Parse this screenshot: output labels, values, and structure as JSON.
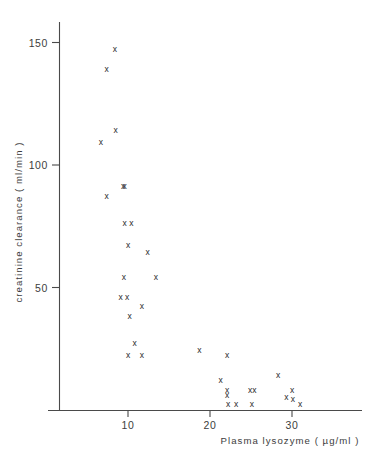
{
  "chart_data": {
    "type": "scatter",
    "title": "",
    "xlabel": "Plasma lysozyme ( µg/ml )",
    "ylabel": "creatinine clearance ( ml/min )",
    "xlim": [
      5,
      37
    ],
    "ylim": [
      0,
      162
    ],
    "grid": false,
    "legend": null,
    "marker": "x",
    "xticks": [
      10,
      20,
      30
    ],
    "xtick_labels": [
      "10",
      "20",
      "30"
    ],
    "yticks": [
      50,
      100,
      150
    ],
    "ytick_labels": [
      "50",
      "100",
      "150"
    ],
    "series": [
      {
        "name": "patients",
        "marker": "x",
        "points": [
          {
            "x": 8.4,
            "y": 147
          },
          {
            "x": 7.4,
            "y": 139
          },
          {
            "x": 8.5,
            "y": 114
          },
          {
            "x": 6.7,
            "y": 109
          },
          {
            "x": 9.4,
            "y": 91
          },
          {
            "x": 9.6,
            "y": 91
          },
          {
            "x": 7.4,
            "y": 87
          },
          {
            "x": 9.6,
            "y": 76
          },
          {
            "x": 10.4,
            "y": 76
          },
          {
            "x": 10.0,
            "y": 67
          },
          {
            "x": 12.4,
            "y": 64
          },
          {
            "x": 9.5,
            "y": 54
          },
          {
            "x": 13.4,
            "y": 54
          },
          {
            "x": 9.1,
            "y": 46
          },
          {
            "x": 9.9,
            "y": 46
          },
          {
            "x": 11.7,
            "y": 42
          },
          {
            "x": 10.2,
            "y": 38
          },
          {
            "x": 10.8,
            "y": 27
          },
          {
            "x": 10.0,
            "y": 22
          },
          {
            "x": 11.7,
            "y": 22
          },
          {
            "x": 18.7,
            "y": 24
          },
          {
            "x": 21.3,
            "y": 12
          },
          {
            "x": 22.1,
            "y": 22
          },
          {
            "x": 22.1,
            "y": 8
          },
          {
            "x": 22.1,
            "y": 6
          },
          {
            "x": 22.2,
            "y": 2
          },
          {
            "x": 23.2,
            "y": 2
          },
          {
            "x": 24.9,
            "y": 8
          },
          {
            "x": 25.1,
            "y": 2
          },
          {
            "x": 25.4,
            "y": 8
          },
          {
            "x": 28.3,
            "y": 14
          },
          {
            "x": 29.3,
            "y": 5
          },
          {
            "x": 30.0,
            "y": 8
          },
          {
            "x": 30.1,
            "y": 4
          },
          {
            "x": 31.0,
            "y": 2
          }
        ]
      }
    ]
  }
}
